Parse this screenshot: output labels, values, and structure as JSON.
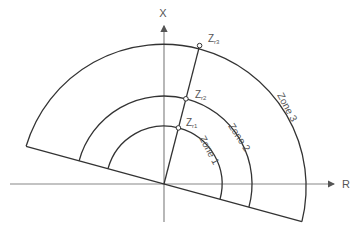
{
  "axes": {
    "x_label": "X",
    "r_label": "R"
  },
  "points": {
    "z1": "Z",
    "z1_sub": "r1",
    "z2": "Z",
    "z2_sub": "r2",
    "z3": "Z",
    "z3_sub": "r3"
  },
  "zones": {
    "zone1": "Zone 1",
    "zone2": "Zone 2",
    "zone3": "Zone 3"
  },
  "colors": {
    "line": "#333333",
    "axis": "#888888",
    "text": "#555555"
  }
}
